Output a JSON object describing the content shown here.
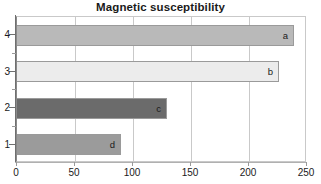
{
  "chart_data": {
    "type": "bar",
    "orientation": "horizontal",
    "title": "Magnetic susceptibility",
    "xlabel": "",
    "ylabel": "",
    "xlim": [
      0,
      250
    ],
    "xticks": [
      0,
      50,
      100,
      150,
      200,
      250
    ],
    "xtick_labels": [
      "0",
      "50",
      "100",
      "150",
      "200",
      "250"
    ],
    "categories": [
      "1",
      "2",
      "3",
      "4"
    ],
    "category_order_top_to_bottom": [
      "4",
      "3",
      "2",
      "1"
    ],
    "grid": "vertical",
    "legend": "none",
    "bars": [
      {
        "category": "4",
        "label": "a",
        "value": 239,
        "color": "#b9b9b9"
      },
      {
        "category": "3",
        "label": "b",
        "value": 226,
        "color": "#ececec"
      },
      {
        "category": "2",
        "label": "c",
        "value": 129,
        "color": "#6b6b6b"
      },
      {
        "category": "1",
        "label": "d",
        "value": 90,
        "color": "#9b9b9b"
      }
    ],
    "values": [
      90,
      129,
      226,
      239
    ],
    "data_labels": [
      "d",
      "c",
      "b",
      "a"
    ]
  },
  "axes": {
    "x_ticks": [
      {
        "label": "0",
        "value": 0
      },
      {
        "label": "50",
        "value": 50
      },
      {
        "label": "100",
        "value": 100
      },
      {
        "label": "150",
        "value": 150
      },
      {
        "label": "200",
        "value": 200
      },
      {
        "label": "250",
        "value": 250
      }
    ],
    "y_ticks": [
      {
        "label": "4"
      },
      {
        "label": "3"
      },
      {
        "label": "2"
      },
      {
        "label": "1"
      }
    ]
  },
  "colors": {
    "background": "#ffffff",
    "grid": "#c9c9c9",
    "axis": "#8a8a8a",
    "text": "#1a1a1a",
    "bar_border": "#9a9a9a"
  }
}
